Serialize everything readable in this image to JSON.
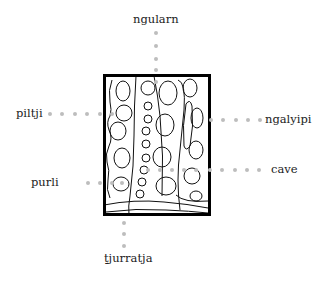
{
  "diagram": {
    "labels": {
      "top": "ngularn",
      "left_upper": "piltji",
      "right_upper": "ngalyipi",
      "left_lower": "purli",
      "right_lower": "cave",
      "bottom": "ṯjurratja"
    },
    "colors": {
      "dots": "#bdbdbd",
      "frame": "#000000",
      "lines": "#111111"
    }
  }
}
